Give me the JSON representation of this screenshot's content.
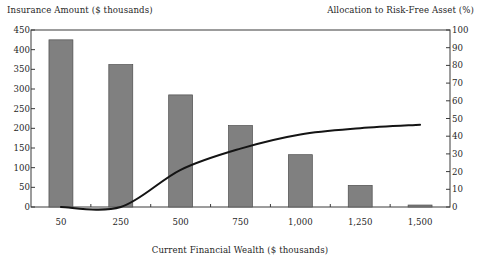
{
  "chart_data": {
    "type": "bar",
    "title": "",
    "subtitle": "",
    "xlabel": "Current Financial Wealth ($ thousands)",
    "ylabel": "Insurance Amount ($ thousands)",
    "ylabel_right": "Allocation to Risk-Free Asset (%)",
    "categories": [
      "50",
      "250",
      "500",
      "750",
      "1,000",
      "1,250",
      "1,500"
    ],
    "ylim": [
      0,
      450
    ],
    "yticks": [
      "0",
      "50",
      "100",
      "150",
      "200",
      "250",
      "300",
      "350",
      "400",
      "450"
    ],
    "ylim_right": [
      0,
      100
    ],
    "yticks_right": [
      "0",
      "10",
      "20",
      "30",
      "40",
      "50",
      "60",
      "70",
      "80",
      "90",
      "100"
    ],
    "grid": false,
    "legend": "none",
    "series": [
      {
        "name": "Insurance Amount ($ thousands)",
        "type": "bar",
        "axis": "left",
        "color": "#808080",
        "values": [
          425,
          362,
          285,
          207,
          133,
          55,
          5
        ]
      },
      {
        "name": "Allocation to Risk-Free Asset (%)",
        "type": "line",
        "axis": "right",
        "color": "#141414",
        "values": [
          0,
          0,
          21,
          33,
          41,
          44.5,
          46.5
        ]
      }
    ]
  },
  "axes": {
    "left_title": "Insurance Amount ($ thousands)",
    "right_title": "Allocation to Risk-Free Asset (%)",
    "x_title": "Current Financial Wealth ($ thousands)"
  },
  "colors": {
    "bar": "#808080",
    "bar_border": "#4d4d4d",
    "line": "#141414",
    "axis": "#3a3a3a",
    "background": "#ffffff",
    "text": "#1f1f1f"
  }
}
